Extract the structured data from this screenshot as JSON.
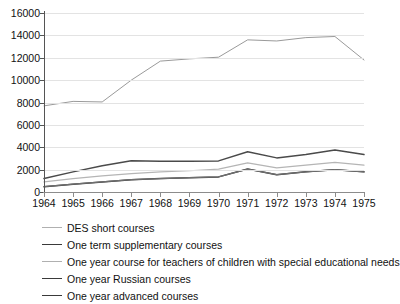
{
  "chart_data": {
    "type": "line",
    "title": "",
    "xlabel": "",
    "ylabel": "",
    "x": [
      1964,
      1965,
      1966,
      1967,
      1968,
      1969,
      1970,
      1971,
      1972,
      1973,
      1974,
      1975
    ],
    "xtick_labels": [
      "1964",
      "1965",
      "1966",
      "1967",
      "1968",
      "1969",
      "1970",
      "1971",
      "1972",
      "1973",
      "1974",
      "1975"
    ],
    "ylim": [
      0,
      16000
    ],
    "ytick_labels": [
      "0",
      "2000",
      "4000",
      "6000",
      "8000",
      "10000",
      "12000",
      "14000",
      "16000"
    ],
    "ytick_values": [
      0,
      2000,
      4000,
      6000,
      8000,
      10000,
      12000,
      14000,
      16000
    ],
    "grid": true,
    "legend_position": "below",
    "series": [
      {
        "name": "DES short courses",
        "color": "#9a9a9a",
        "width": 1.0,
        "values": [
          7700,
          8100,
          8050,
          10000,
          11700,
          11900,
          12050,
          13600,
          13500,
          13800,
          13900,
          11800
        ]
      },
      {
        "name": "One term supplementary courses",
        "color": "#4a4a4a",
        "width": 1.5,
        "values": [
          1200,
          1800,
          2350,
          2800,
          2750,
          2750,
          2780,
          3600,
          3050,
          3350,
          3750,
          3350
        ]
      },
      {
        "name": "One year course for teachers of children with special educational needs",
        "color": "#b5b5b5",
        "width": 1.2,
        "values": [
          900,
          1200,
          1450,
          1650,
          1800,
          1900,
          2050,
          2600,
          2150,
          2400,
          2650,
          2400
        ]
      },
      {
        "name": "One year Russian courses",
        "color": "#3a3a3a",
        "width": 1.5,
        "values": [
          480,
          700,
          900,
          1100,
          1200,
          1280,
          1350,
          2050,
          1550,
          1800,
          2000,
          1800
        ]
      },
      {
        "name": "One year advanced courses",
        "color": "#6f6f6f",
        "width": 1.2,
        "values": [
          480,
          700,
          900,
          1100,
          1200,
          1280,
          1350,
          2050,
          1550,
          1800,
          2000,
          1800
        ]
      }
    ]
  },
  "legend": {
    "items": [
      {
        "label": "DES short courses",
        "color": "#b0b0b0",
        "width": 1.1
      },
      {
        "label": "One term supplementary courses",
        "color": "#3a3a3a",
        "width": 1.6
      },
      {
        "label": "One year course for teachers of children with special educational needs",
        "color": "#b0b0b0",
        "width": 1.1
      },
      {
        "label": "One year Russian courses",
        "color": "#3a3a3a",
        "width": 1.6
      },
      {
        "label": "One year advanced courses",
        "color": "#3a3a3a",
        "width": 1.6
      }
    ]
  }
}
